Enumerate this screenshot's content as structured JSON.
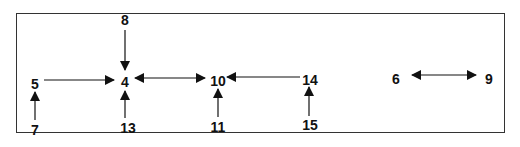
{
  "diagram": {
    "type": "directed-graph",
    "nodes": [
      {
        "id": "8",
        "label": "8",
        "x": 125,
        "y": 20
      },
      {
        "id": "5",
        "label": "5",
        "x": 35,
        "y": 84
      },
      {
        "id": "4",
        "label": "4",
        "x": 125,
        "y": 82
      },
      {
        "id": "10",
        "label": "10",
        "x": 218,
        "y": 81
      },
      {
        "id": "14",
        "label": "14",
        "x": 310,
        "y": 80
      },
      {
        "id": "6",
        "label": "6",
        "x": 396,
        "y": 79
      },
      {
        "id": "9",
        "label": "9",
        "x": 489,
        "y": 79
      },
      {
        "id": "7",
        "label": "7",
        "x": 35,
        "y": 130
      },
      {
        "id": "13",
        "label": "13",
        "x": 128,
        "y": 128
      },
      {
        "id": "11",
        "label": "11",
        "x": 218,
        "y": 127
      },
      {
        "id": "15",
        "label": "15",
        "x": 310,
        "y": 125
      }
    ],
    "edges": [
      {
        "from": "8",
        "to": "4",
        "direction": "forward"
      },
      {
        "from": "5",
        "to": "4",
        "direction": "forward"
      },
      {
        "from": "7",
        "to": "5",
        "direction": "forward"
      },
      {
        "from": "13",
        "to": "4",
        "direction": "forward"
      },
      {
        "from": "4",
        "to": "10",
        "direction": "both"
      },
      {
        "from": "14",
        "to": "10",
        "direction": "forward"
      },
      {
        "from": "11",
        "to": "10",
        "direction": "forward"
      },
      {
        "from": "15",
        "to": "14",
        "direction": "forward"
      },
      {
        "from": "6",
        "to": "9",
        "direction": "both"
      }
    ]
  }
}
